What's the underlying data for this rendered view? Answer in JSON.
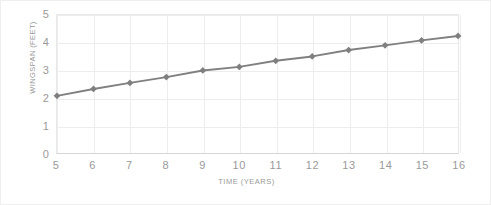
{
  "chart_data": {
    "type": "line",
    "title": "",
    "xlabel": "TIME (YEARS)",
    "ylabel": "WINGSPAN (FEET)",
    "x": [
      5,
      6,
      7,
      8,
      9,
      10,
      11,
      12,
      13,
      14,
      15,
      16
    ],
    "values": [
      2.07,
      2.32,
      2.54,
      2.75,
      2.99,
      3.12,
      3.34,
      3.5,
      3.73,
      3.9,
      4.08,
      4.24
    ],
    "series": [
      {
        "name": "Wingspan",
        "values": [
          2.07,
          2.32,
          2.54,
          2.75,
          2.99,
          3.12,
          3.34,
          3.5,
          3.73,
          3.9,
          4.08,
          4.24
        ]
      }
    ],
    "xlim": [
      5,
      16
    ],
    "ylim": [
      0,
      5
    ],
    "x_ticks": [
      "5",
      "6",
      "7",
      "8",
      "9",
      "10",
      "11",
      "12",
      "13",
      "14",
      "15",
      "16"
    ],
    "y_ticks": [
      "0",
      "1",
      "2",
      "3",
      "4",
      "5"
    ],
    "y_tick_values": [
      0,
      1,
      2,
      3,
      4,
      5
    ],
    "grid": {
      "horizontal": true,
      "vertical": true
    },
    "legend": {
      "visible": false,
      "position": "none"
    },
    "marker": {
      "shape": "diamond",
      "color": "#7f7f7f"
    },
    "line": {
      "color": "#808080",
      "width": 2
    },
    "colors": {
      "line": "#808080",
      "marker": "#7f7f7f",
      "grid": "#ededed",
      "axis_text": "#9a9a9a",
      "border": "#efefef",
      "background": "#ffffff"
    }
  }
}
